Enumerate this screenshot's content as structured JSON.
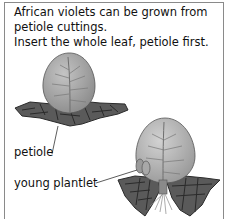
{
  "caption": {
    "lines": [
      "African violets can be grown from",
      "petiole cuttings.",
      "Insert the whole leaf, petiole first."
    ]
  },
  "labels": {
    "petiole": "petiole",
    "young_plantlet": "young plantlet"
  },
  "colors": {
    "leaf": "#a9a9a9",
    "leaf_vein": "#6f6f6f",
    "soil": "#555555",
    "soil_cracks": "#2a2a2a",
    "frame": "#8a8a8a",
    "text": "#111111"
  }
}
